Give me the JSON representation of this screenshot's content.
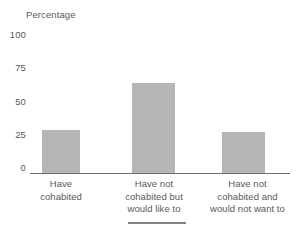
{
  "chart_data": {
    "type": "bar",
    "title": "",
    "subtitle": "",
    "xlabel": "",
    "ylabel": "Percentage",
    "ylim": [
      0,
      100
    ],
    "yticks": [
      "100",
      "75",
      "50",
      "25",
      "0"
    ],
    "ytick_values": [
      100,
      75,
      50,
      25,
      0
    ],
    "grid": false,
    "legend": null,
    "categories": [
      "Have cohabited",
      "Have not cohabited but would like to",
      "Have not cohabited and would not want to"
    ],
    "category_lines": [
      [
        "Have",
        "cohabited"
      ],
      [
        "Have not",
        "cohabited but",
        "would like to"
      ],
      [
        "Have not",
        "cohabited and",
        "would not want to"
      ]
    ],
    "values": [
      28,
      59,
      27
    ],
    "bar_color": "#b6b6b6",
    "axis_color": "#6d6e71",
    "text_color": "#58595b"
  },
  "footer": {
    "rule_color": "#808285"
  }
}
